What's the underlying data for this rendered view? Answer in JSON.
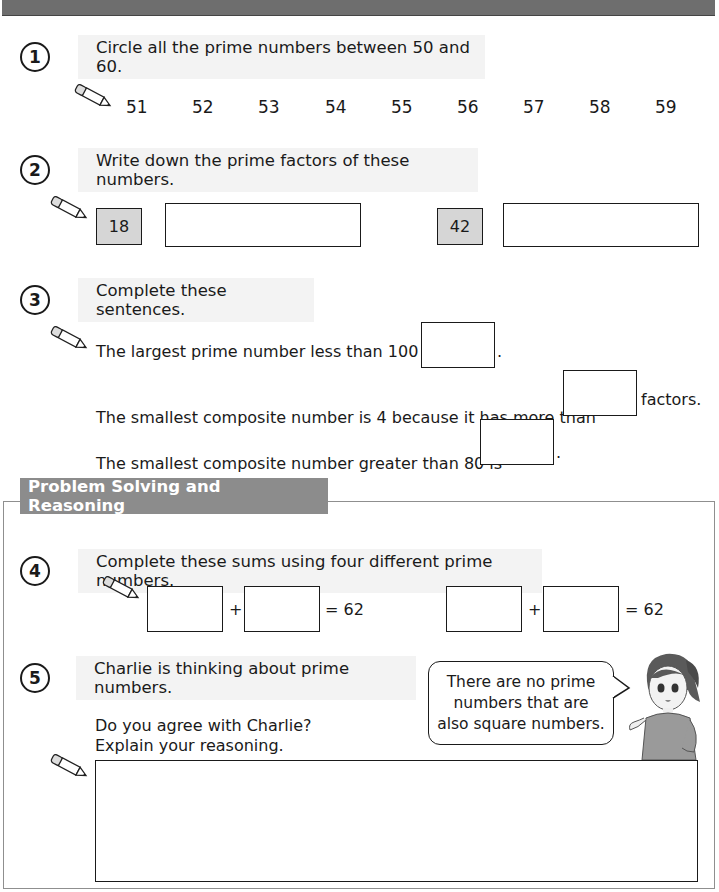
{
  "questions": {
    "q1": {
      "number": "1",
      "instruction": "Circle all the prime numbers between 50 and 60.",
      "numbers": [
        "51",
        "52",
        "53",
        "54",
        "55",
        "56",
        "57",
        "58",
        "59"
      ]
    },
    "q2": {
      "number": "2",
      "instruction": "Write down the prime factors of these numbers.",
      "items": [
        {
          "value": "18"
        },
        {
          "value": "42"
        }
      ]
    },
    "q3": {
      "number": "3",
      "instruction": "Complete these sentences.",
      "sentence1_before": "The largest prime number less than 100 is",
      "sentence1_after": ".",
      "sentence2_before": "The smallest composite number is 4 because it has more than",
      "sentence2_after": "factors.",
      "sentence3_before": "The smallest composite number greater than 80 is",
      "sentence3_after": "."
    },
    "section": {
      "title": "Problem Solving and Reasoning"
    },
    "q4": {
      "number": "4",
      "instruction": "Complete these sums using four different prime numbers.",
      "plus": "+",
      "equals": "= 62"
    },
    "q5": {
      "number": "5",
      "instruction": "Charlie is thinking about prime numbers.",
      "question_line1": "Do you agree with Charlie?",
      "question_line2": "Explain your reasoning.",
      "speech_line1": "There are no prime",
      "speech_line2": "numbers that are",
      "speech_line3": "also square numbers."
    }
  },
  "colors": {
    "topbar": "#6e6e6e",
    "instruction_bg": "#f3f3f3",
    "section_tag": "#8c8c8c",
    "given_box": "#d6d6d6"
  }
}
